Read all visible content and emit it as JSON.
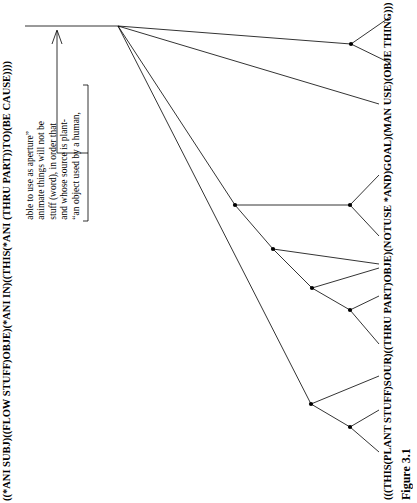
{
  "figure": {
    "caption": "Figure 3.1",
    "top_formula": "((*ANI SUBJ)((FLOW STUFF)OBJE)(*ANI IN)((THIS(*ANI (THRU PART))TO)(BE CAUSE))))",
    "bottom_formula": "(((THIS(PLANT STUFF)SOUR)((THRU PART)OBJE)(NOTUSE *AND)GOAL)(MAN USE)(OBJE THING)))",
    "gloss_lines": [
      "“an object used by a human,",
      "and whose source is plant-",
      "stuff (word), in order that",
      "animate things will not be",
      "able to use as aperture”"
    ],
    "ink_color": "#000000",
    "background_color": "#ffffff"
  },
  "tree": {
    "type": "tree-diagram",
    "root": {
      "x": 118,
      "y": 26
    },
    "header_bar": {
      "x1": 25,
      "y1": 26,
      "x2": 118,
      "y2": 26
    },
    "nodes": [
      {
        "id": "root",
        "x": 118,
        "y": 26
      },
      {
        "id": "n1",
        "x": 351,
        "y": 44
      },
      {
        "id": "n2",
        "x": 235,
        "y": 205
      },
      {
        "id": "n3",
        "x": 273,
        "y": 249
      },
      {
        "id": "n4",
        "x": 312,
        "y": 288
      },
      {
        "id": "n5",
        "x": 350,
        "y": 205
      },
      {
        "id": "n6",
        "x": 350,
        "y": 310
      },
      {
        "id": "n7",
        "x": 311,
        "y": 404
      },
      {
        "id": "n8",
        "x": 350,
        "y": 427
      }
    ],
    "edges": [
      {
        "from": "root",
        "to": "n1"
      },
      {
        "from": "n1",
        "to": {
          "x": 389,
          "y": 18
        }
      },
      {
        "from": "n1",
        "to": {
          "x": 389,
          "y": 62
        }
      },
      {
        "from": "root",
        "to": {
          "x": 378,
          "y": 104
        }
      },
      {
        "from": "root",
        "to": "n2"
      },
      {
        "from": "n2",
        "to": "n5"
      },
      {
        "from": "n5",
        "to": {
          "x": 379,
          "y": 175
        }
      },
      {
        "from": "n5",
        "to": {
          "x": 379,
          "y": 236
        }
      },
      {
        "from": "n2",
        "to": "n3"
      },
      {
        "from": "n3",
        "to": {
          "x": 379,
          "y": 265
        }
      },
      {
        "from": "n3",
        "to": "n4"
      },
      {
        "from": "n4",
        "to": {
          "x": 379,
          "y": 268
        }
      },
      {
        "from": "n4",
        "to": "n6"
      },
      {
        "from": "n6",
        "to": {
          "x": 379,
          "y": 296
        }
      },
      {
        "from": "n6",
        "to": {
          "x": 379,
          "y": 344
        }
      },
      {
        "from": "root",
        "to": "n7"
      },
      {
        "from": "n7",
        "to": {
          "x": 379,
          "y": 376
        }
      },
      {
        "from": "n7",
        "to": "n8"
      },
      {
        "from": "n8",
        "to": {
          "x": 379,
          "y": 410
        }
      },
      {
        "from": "n8",
        "to": {
          "x": 379,
          "y": 452
        }
      }
    ],
    "annotation_bracket": {
      "x": 88,
      "y_top": 88,
      "y_bottom": 218,
      "tick": 5
    },
    "annotation_arrow": {
      "x": 57,
      "y_from": 153,
      "y_to": 30
    }
  }
}
